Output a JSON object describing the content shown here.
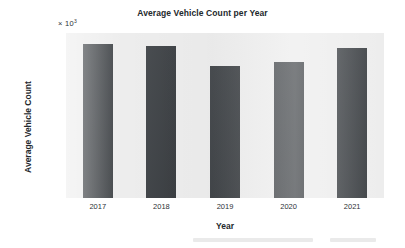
{
  "chart_data": {
    "type": "bar",
    "title": "Average Vehicle Count per Year",
    "xlabel": "Year",
    "ylabel": "Average Vehicle Count",
    "multiplier_prefix": "× 10",
    "multiplier_exponent": "3",
    "categories": [
      "2017",
      "2018",
      "2019",
      "2020",
      "2021"
    ],
    "values": [
      98,
      97,
      84,
      86.5,
      95.5
    ],
    "ytick_labels": [
      "100",
      "80",
      "60",
      "40",
      "20",
      "10",
      "0"
    ],
    "ytick_values": [
      100,
      80,
      60,
      40,
      20,
      10,
      0
    ],
    "ytick_pixel_y": [
      8,
      27,
      45,
      63,
      82,
      123,
      165
    ],
    "ylim": [
      0,
      106
    ],
    "grid": false,
    "legend": null,
    "bar_color": "#3f4347",
    "plot_background": "#ededed",
    "figure_background": "#ffffff",
    "text_color": "#23282c"
  }
}
